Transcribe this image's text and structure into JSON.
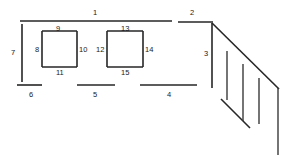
{
  "diagram": {
    "type": "technical-line-drawing",
    "background_color": "#ffffff",
    "line_color": "#262626",
    "label_color": "#1a1a1a",
    "width": 294,
    "height": 162,
    "labels": [
      {
        "id": "label-1",
        "text": "1",
        "x": 93,
        "y": 9
      },
      {
        "id": "label-2",
        "text": "2",
        "x": 190,
        "y": 9
      },
      {
        "id": "label-3",
        "text": "3",
        "x": 204,
        "y": 50
      },
      {
        "id": "label-4",
        "text": "4",
        "x": 167,
        "y": 91
      },
      {
        "id": "label-5",
        "text": "5",
        "x": 93,
        "y": 91
      },
      {
        "id": "label-6",
        "text": "6",
        "x": 29,
        "y": 91
      },
      {
        "id": "label-7",
        "text": "7",
        "x": 11,
        "y": 49
      },
      {
        "id": "label-8",
        "text": "8",
        "x": 35,
        "y": 46
      },
      {
        "id": "label-9",
        "text": "9",
        "x": 56,
        "y": 25
      },
      {
        "id": "label-10",
        "text": "10",
        "x": 79,
        "y": 46
      },
      {
        "id": "label-11",
        "text": "11",
        "x": 56,
        "y": 69
      },
      {
        "id": "label-12",
        "text": "12",
        "x": 96,
        "y": 46
      },
      {
        "id": "label-13",
        "text": "13",
        "x": 121,
        "y": 25
      },
      {
        "id": "label-14",
        "text": "14",
        "x": 145,
        "y": 46
      },
      {
        "id": "label-15",
        "text": "15",
        "x": 121,
        "y": 69
      }
    ],
    "segments": [
      {
        "id": "seg-top-1",
        "x1": 20,
        "y1": 21,
        "x2": 172,
        "y2": 21
      },
      {
        "id": "seg-top-2",
        "x1": 178,
        "y1": 22,
        "x2": 213,
        "y2": 22
      },
      {
        "id": "seg-left-7",
        "x1": 22,
        "y1": 24,
        "x2": 22,
        "y2": 82
      },
      {
        "id": "seg-right-3",
        "x1": 212,
        "y1": 23,
        "x2": 212,
        "y2": 88
      },
      {
        "id": "seg-bottom-6",
        "x1": 17,
        "y1": 85,
        "x2": 42,
        "y2": 85
      },
      {
        "id": "seg-bottom-5",
        "x1": 77,
        "y1": 85,
        "x2": 115,
        "y2": 85
      },
      {
        "id": "seg-bottom-4",
        "x1": 140,
        "y1": 85,
        "x2": 197,
        "y2": 85
      },
      {
        "id": "sq1-top-9",
        "x1": 42,
        "y1": 31,
        "x2": 77,
        "y2": 31
      },
      {
        "id": "sq1-left-8",
        "x1": 42,
        "y1": 31,
        "x2": 42,
        "y2": 67
      },
      {
        "id": "sq1-right-10",
        "x1": 77,
        "y1": 31,
        "x2": 77,
        "y2": 67
      },
      {
        "id": "sq1-bottom-11",
        "x1": 42,
        "y1": 67,
        "x2": 77,
        "y2": 67
      },
      {
        "id": "sq2-top-13",
        "x1": 107,
        "y1": 31,
        "x2": 143,
        "y2": 31
      },
      {
        "id": "sq2-left-12",
        "x1": 107,
        "y1": 31,
        "x2": 107,
        "y2": 67
      },
      {
        "id": "sq2-right-14",
        "x1": 143,
        "y1": 31,
        "x2": 143,
        "y2": 67
      },
      {
        "id": "sq2-bottom-15",
        "x1": 107,
        "y1": 67,
        "x2": 143,
        "y2": 67
      },
      {
        "id": "diagonal-main",
        "x1": 212,
        "y1": 23,
        "x2": 279,
        "y2": 89
      },
      {
        "id": "diagonal-lower",
        "x1": 221,
        "y1": 99,
        "x2": 250,
        "y2": 128
      },
      {
        "id": "tick-1",
        "x1": 227,
        "y1": 51,
        "x2": 227,
        "y2": 100
      },
      {
        "id": "tick-2",
        "x1": 243,
        "y1": 64,
        "x2": 243,
        "y2": 121
      },
      {
        "id": "tick-3",
        "x1": 259,
        "y1": 78,
        "x2": 259,
        "y2": 124
      },
      {
        "id": "tick-4",
        "x1": 278,
        "y1": 88,
        "x2": 278,
        "y2": 155
      }
    ]
  }
}
